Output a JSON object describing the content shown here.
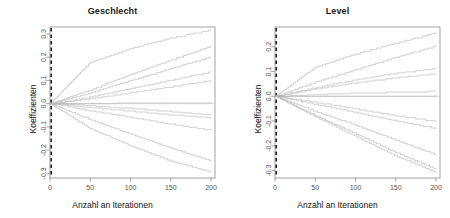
{
  "figure": {
    "background": "#ffffff",
    "curve_color": "#b9b9b9",
    "zero_line_color": "#c4c4c4",
    "axis_color": "#8c8c8c",
    "dashed_line_color": "#111111",
    "tick_label_color": "#555555"
  },
  "chart_data": [
    {
      "type": "line",
      "title": "Geschlecht",
      "xlabel": "Anzahl an Iterationen",
      "ylabel": "Koeffizienten",
      "x": [
        0,
        50,
        100,
        150,
        200
      ],
      "xticks": [
        "0",
        "50",
        "100",
        "150",
        "200"
      ],
      "xlim": [
        0,
        205
      ],
      "yticks": [
        "0.3",
        "0.2",
        "0.1",
        "0.0",
        "-0.1",
        "-0.2",
        "-0.3"
      ],
      "ytickvals": [
        0.3,
        0.2,
        0.1,
        0.0,
        -0.1,
        -0.2,
        -0.3
      ],
      "ylim": [
        -0.32,
        0.33
      ],
      "grid": false,
      "legend": "none",
      "vline_at": 0,
      "hline_at": 0,
      "series": [
        {
          "name": "path-1",
          "style": "step",
          "values": [
            0.0,
            0.178,
            0.238,
            0.284,
            0.318
          ]
        },
        {
          "name": "path-2",
          "style": "step",
          "values": [
            0.0,
            0.06,
            0.126,
            0.188,
            0.248
          ]
        },
        {
          "name": "path-3",
          "style": "step",
          "values": [
            0.0,
            0.047,
            0.1,
            0.152,
            0.202
          ]
        },
        {
          "name": "path-4",
          "style": "step",
          "values": [
            0.0,
            0.03,
            0.066,
            0.102,
            0.138
          ]
        },
        {
          "name": "path-5",
          "style": "step",
          "values": [
            0.0,
            0.022,
            0.048,
            0.074,
            0.101
          ]
        },
        {
          "name": "path-6",
          "style": "step",
          "values": [
            0.0,
            0.002,
            0.004,
            0.005,
            0.006
          ]
        },
        {
          "name": "path-7",
          "style": "step",
          "values": [
            0.0,
            -0.01,
            -0.022,
            -0.036,
            -0.05
          ]
        },
        {
          "name": "path-8",
          "style": "step",
          "values": [
            0.0,
            -0.018,
            -0.034,
            -0.05,
            -0.062
          ]
        },
        {
          "name": "path-9",
          "style": "step",
          "values": [
            0.0,
            -0.032,
            -0.06,
            -0.09,
            -0.116
          ]
        },
        {
          "name": "path-10",
          "style": "step",
          "values": [
            0.0,
            -0.07,
            -0.132,
            -0.192,
            -0.248
          ]
        },
        {
          "name": "path-11",
          "style": "step",
          "values": [
            0.0,
            -0.108,
            -0.182,
            -0.248,
            -0.296
          ]
        }
      ]
    },
    {
      "type": "line",
      "title": "Level",
      "xlabel": "Anzahl an Iterationen",
      "ylabel": "Koeffizienten",
      "x": [
        0,
        50,
        100,
        150,
        200
      ],
      "xticks": [
        "0",
        "50",
        "100",
        "150",
        "200"
      ],
      "xlim": [
        0,
        205
      ],
      "yticks": [
        "0.2",
        "0.1",
        "0.0",
        "-0.1",
        "-0.2",
        "-0.3"
      ],
      "ytickvals": [
        0.2,
        0.1,
        0.0,
        -0.1,
        -0.2,
        -0.3
      ],
      "ylim": [
        -0.33,
        0.28
      ],
      "grid": false,
      "legend": "none",
      "vline_at": 0,
      "hline_at": 0,
      "series": [
        {
          "name": "path-1",
          "style": "step",
          "values": [
            0.0,
            0.118,
            0.172,
            0.216,
            0.258
          ]
        },
        {
          "name": "path-2",
          "style": "step",
          "values": [
            0.0,
            0.058,
            0.108,
            0.158,
            0.204
          ]
        },
        {
          "name": "path-3",
          "style": "step",
          "values": [
            0.0,
            0.036,
            0.068,
            0.094,
            0.114
          ]
        },
        {
          "name": "path-4",
          "style": "step",
          "values": [
            0.0,
            0.03,
            0.056,
            0.076,
            0.092
          ]
        },
        {
          "name": "path-5",
          "style": "step",
          "values": [
            0.0,
            0.008,
            0.014,
            0.018,
            0.022
          ]
        },
        {
          "name": "path-6",
          "style": "step",
          "values": [
            0.0,
            0.001,
            0.002,
            0.002,
            0.003
          ]
        },
        {
          "name": "path-7",
          "style": "step",
          "values": [
            0.0,
            -0.026,
            -0.052,
            -0.08,
            -0.104
          ]
        },
        {
          "name": "path-8",
          "style": "step",
          "values": [
            0.0,
            -0.034,
            -0.066,
            -0.1,
            -0.132
          ]
        },
        {
          "name": "path-9",
          "style": "step",
          "values": [
            0.0,
            -0.062,
            -0.118,
            -0.178,
            -0.238
          ]
        },
        {
          "name": "path-10",
          "style": "step",
          "values": [
            0.0,
            -0.078,
            -0.152,
            -0.228,
            -0.296
          ]
        },
        {
          "name": "path-11",
          "style": "step",
          "values": [
            0.0,
            -0.084,
            -0.162,
            -0.242,
            -0.308
          ]
        }
      ]
    }
  ]
}
